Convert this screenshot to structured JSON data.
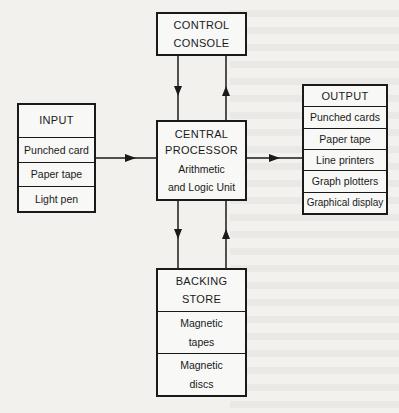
{
  "diagram": {
    "control_console": {
      "line1": "CONTROL",
      "line2": "CONSOLE"
    },
    "input": {
      "title": "INPUT",
      "items": [
        "Punched card",
        "Paper tape",
        "Light pen"
      ]
    },
    "central_processor": {
      "line1": "CENTRAL",
      "line2": "PROCESSOR",
      "line3": "Arithmetic",
      "line4": "and Logic Unit"
    },
    "output": {
      "title": "OUTPUT",
      "items": [
        "Punched cards",
        "Paper tape",
        "Line printers",
        "Graph plotters",
        "Graphical display"
      ]
    },
    "backing_store": {
      "title_line1": "BACKING",
      "title_line2": "STORE",
      "items": [
        {
          "line1": "Magnetic",
          "line2": "tapes"
        },
        {
          "line1": "Magnetic",
          "line2": "discs"
        }
      ]
    },
    "colors": {
      "ink": "#1a1a1a",
      "paper": "#f2f1ee"
    }
  }
}
